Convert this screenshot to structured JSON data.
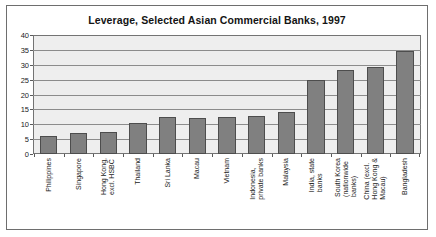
{
  "chart_data": {
    "type": "bar",
    "title": "Leverage, Selected Asian Commercial Banks, 1997",
    "xlabel": "",
    "ylabel": "",
    "ylim": [
      0,
      40
    ],
    "yticks": [
      0,
      5,
      10,
      15,
      20,
      25,
      30,
      35,
      40
    ],
    "grid": true,
    "legend": "none",
    "bar_color": "#808080",
    "bar_edge_color": "#4d4d4d",
    "plot_background": "#eeeeee",
    "categories": [
      "Philippines",
      "Singapore",
      "Hong Kong,\nexcl. HSBC",
      "Thailand",
      "Sri Lanka",
      "Macau",
      "Vietnam",
      "Indonesia,\nprivate banks",
      "Malaysia",
      "India, state\nbanks",
      "South Korea\n(nationwide\nbanks)",
      "China (excl.\nHong Kong &\nMacau)",
      "Bangladesh"
    ],
    "values": [
      6,
      7,
      7.5,
      10.5,
      12.3,
      12.2,
      12.5,
      12.7,
      14,
      25,
      28.2,
      29.3,
      34.7
    ]
  }
}
